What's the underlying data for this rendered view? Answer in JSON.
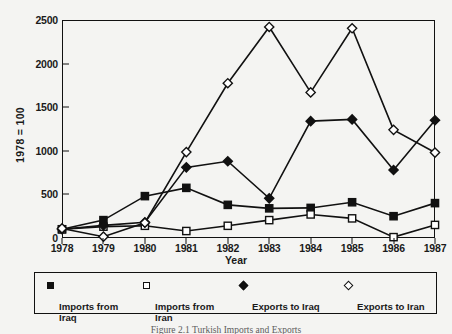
{
  "chart_data": {
    "type": "line",
    "title": "",
    "xlabel": "Year",
    "ylabel": "1978 = 100",
    "categories": [
      "1978",
      "1979",
      "1980",
      "1981",
      "1982",
      "1983",
      "1984",
      "1985",
      "1986",
      "1987"
    ],
    "x": [
      1978,
      1979,
      1980,
      1981,
      1982,
      1983,
      1984,
      1985,
      1986,
      1987
    ],
    "xlim": [
      1978,
      1987
    ],
    "ylim": [
      0,
      2500
    ],
    "yticks": [
      0,
      500,
      1000,
      1500,
      2000,
      2500
    ],
    "ytick_labels": [
      "0",
      "500",
      "1000",
      "1500",
      "2000",
      "2500"
    ],
    "grid": false,
    "legend_position": "below-axes",
    "series": [
      {
        "name": "Imports from Iraq",
        "marker": "filled-square",
        "color": "#111111",
        "values": [
          100,
          205,
          480,
          575,
          380,
          340,
          345,
          410,
          250,
          400
        ]
      },
      {
        "name": "Imports from Iran",
        "marker": "open-square",
        "color": "#111111",
        "values": [
          100,
          130,
          140,
          80,
          140,
          205,
          270,
          225,
          10,
          150
        ]
      },
      {
        "name": "Exports to Iraq",
        "marker": "filled-diamond",
        "color": "#111111",
        "values": [
          100,
          145,
          180,
          810,
          880,
          455,
          1340,
          1360,
          780,
          1350
        ]
      },
      {
        "name": "Exports to Iran",
        "marker": "open-diamond",
        "color": "#111111",
        "values": [
          110,
          15,
          175,
          985,
          1775,
          2420,
          1670,
          2405,
          1240,
          980
        ]
      }
    ]
  },
  "axes": {
    "y_axis_label": "1978 = 100",
    "x_axis_title": "Year",
    "y_tick_labels": [
      "2500",
      "2000",
      "1500",
      "1000",
      "500",
      "0"
    ],
    "x_tick_labels": [
      "1978",
      "1979",
      "1980",
      "1981",
      "1982",
      "1983",
      "1984",
      "1985",
      "1986",
      "1987"
    ]
  },
  "legend": {
    "entries": [
      {
        "label": "Imports from\nIraq",
        "marker": "filled-square"
      },
      {
        "label": "Imports from\nIran",
        "marker": "open-square"
      },
      {
        "label": "Exports to Iraq",
        "marker": "filled-diamond"
      },
      {
        "label": "Exports to Iran",
        "marker": "open-diamond"
      }
    ]
  },
  "caption": {
    "text": "Figure 2.1   Turkish Imports and Exports"
  }
}
